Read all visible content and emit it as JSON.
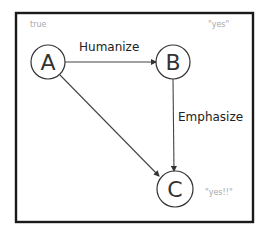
{
  "diagram": {
    "type": "directed-graph",
    "frame": {
      "x": 16,
      "y": 13,
      "width": 237,
      "height": 209,
      "color": "#1a1a1a"
    },
    "nodes": [
      {
        "id": "A",
        "label": "A",
        "cx": 48,
        "cy": 62,
        "r": 17,
        "note": "true",
        "note_x": 30,
        "note_y": 27
      },
      {
        "id": "B",
        "label": "B",
        "cx": 173,
        "cy": 62,
        "r": 17,
        "note": "\"yes\"",
        "note_x": 208,
        "note_y": 27
      },
      {
        "id": "C",
        "label": "C",
        "cx": 175,
        "cy": 189,
        "r": 18,
        "note": "\"yes!!\"",
        "note_x": 205,
        "note_y": 195
      }
    ],
    "edges": [
      {
        "from": "A",
        "to": "B",
        "label": "Humanize",
        "label_x": 79,
        "label_y": 51
      },
      {
        "from": "B",
        "to": "C",
        "label": "Emphasize",
        "label_x": 178,
        "label_y": 121
      },
      {
        "from": "A",
        "to": "C",
        "label": "",
        "label_x": 0,
        "label_y": 0
      }
    ]
  }
}
